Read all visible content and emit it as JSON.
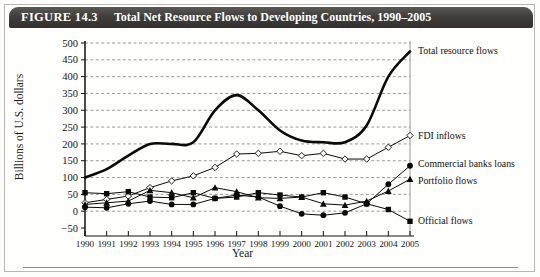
{
  "figure": {
    "number": "FIGURE 14.3",
    "caption": "Total Net Resource Flows to Developing Countries, 1990–2005",
    "title_bar_color": "#403e3a",
    "background_color": "#fefefd"
  },
  "chart_data": {
    "type": "line",
    "title": "Total Net Resource Flows to Developing Countries, 1990–2005",
    "xlabel": "Year",
    "ylabel": "Billions of U.S. dollars",
    "xlim": [
      1990,
      2005
    ],
    "ylim": [
      -50,
      500
    ],
    "ytick_step": 50,
    "yticks": [
      -50,
      0,
      50,
      100,
      150,
      200,
      250,
      300,
      350,
      400,
      450,
      500
    ],
    "grid": true,
    "grid_style": "dashed-horizontal",
    "legend_position": "right-inline-labels",
    "x": [
      1990,
      1991,
      1992,
      1993,
      1994,
      1995,
      1996,
      1997,
      1998,
      1999,
      2000,
      2001,
      2002,
      2003,
      2004,
      2005
    ],
    "categories": [
      "1990",
      "1991",
      "1992",
      "1993",
      "1994",
      "1995",
      "1996",
      "1997",
      "1998",
      "1999",
      "2000",
      "2001",
      "2002",
      "2003",
      "2004",
      "2005"
    ],
    "series": [
      {
        "name": "Total resource flows",
        "marker": "none",
        "line_width": 2.6,
        "smooth": true,
        "values": [
          100,
          125,
          165,
          200,
          200,
          205,
          300,
          345,
          300,
          240,
          210,
          205,
          205,
          255,
          400,
          475
        ]
      },
      {
        "name": "FDI inflows",
        "marker": "open-diamond",
        "line_width": 1.0,
        "smooth": false,
        "values": [
          25,
          35,
          45,
          70,
          90,
          105,
          130,
          170,
          172,
          178,
          165,
          172,
          155,
          155,
          190,
          225
        ]
      },
      {
        "name": "Commercial banks loans",
        "marker": "filled-circle",
        "line_width": 1.0,
        "smooth": false,
        "values": [
          12,
          10,
          22,
          30,
          20,
          20,
          38,
          48,
          42,
          15,
          -8,
          -12,
          -5,
          22,
          80,
          135
        ]
      },
      {
        "name": "Portfolio flows",
        "marker": "filled-triangle",
        "line_width": 1.0,
        "smooth": false,
        "values": [
          20,
          25,
          30,
          62,
          55,
          40,
          70,
          58,
          40,
          38,
          42,
          22,
          18,
          30,
          60,
          95
        ]
      },
      {
        "name": "Official flows",
        "marker": "filled-square",
        "line_width": 1.0,
        "smooth": false,
        "values": [
          55,
          52,
          58,
          42,
          40,
          55,
          38,
          42,
          55,
          48,
          42,
          55,
          42,
          22,
          5,
          -30
        ]
      }
    ]
  }
}
